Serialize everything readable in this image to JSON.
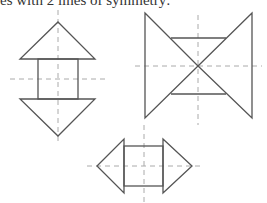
{
  "caption": "es with 2 lines of symmetry:",
  "figures": [
    {
      "name": "vertical-arrow-shape",
      "axes": 2
    },
    {
      "name": "bowtie-shape",
      "axes": 2
    },
    {
      "name": "horizontal-arrow-shape",
      "axes": 2
    }
  ],
  "colors": {
    "stroke": "#555555",
    "dash": "#aaaaaa"
  }
}
